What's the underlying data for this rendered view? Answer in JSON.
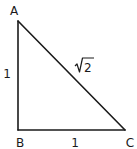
{
  "diagram": {
    "type": "right-triangle",
    "vertices": {
      "A": {
        "label": "A"
      },
      "B": {
        "label": "B"
      },
      "C": {
        "label": "C"
      }
    },
    "sides": {
      "AB": {
        "label": "1"
      },
      "BC": {
        "label": "1"
      },
      "AC": {
        "label": "√2",
        "radicand": "2"
      }
    },
    "right_angle_at": "B",
    "colors": {
      "stroke": "#1a1a1a",
      "background": "#ffffff"
    }
  }
}
